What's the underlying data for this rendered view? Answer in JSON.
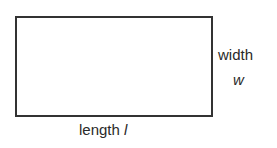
{
  "diagram": {
    "shape": "rectangle",
    "border_color": "#333333",
    "labels": {
      "width_word": "width",
      "width_variable": "w",
      "length_word": "length",
      "length_variable": "l"
    }
  }
}
